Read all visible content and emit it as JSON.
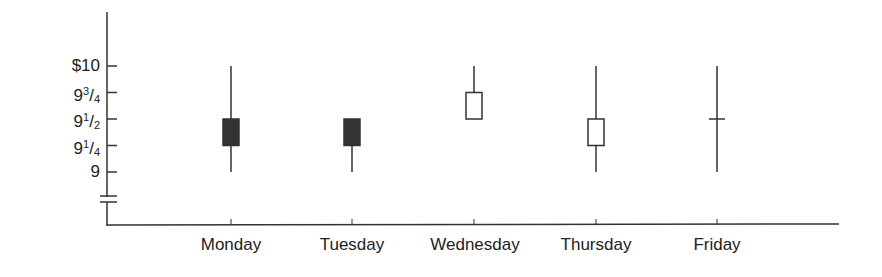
{
  "chart_data": {
    "type": "candlestick",
    "title": "",
    "xlabel": "",
    "ylabel": "",
    "categories": [
      "Monday",
      "Tuesday",
      "Wednesday",
      "Thursday",
      "Friday"
    ],
    "y_ticks": [
      {
        "value": 10,
        "label": "$10"
      },
      {
        "value": 9.75,
        "whole": "9",
        "num": "3",
        "den": "4"
      },
      {
        "value": 9.5,
        "whole": "9",
        "num": "1",
        "den": "2"
      },
      {
        "value": 9.25,
        "whole": "9",
        "num": "1",
        "den": "4"
      },
      {
        "value": 9,
        "label": "9"
      }
    ],
    "ylim": [
      9,
      10
    ],
    "axis_break": true,
    "grid": false,
    "series": [
      {
        "day": "Monday",
        "high": 10,
        "low": 9,
        "open": 9.5,
        "close": 9.25,
        "body": "filled"
      },
      {
        "day": "Tuesday",
        "high": 9.5,
        "low": 9,
        "open": 9.5,
        "close": 9.25,
        "body": "filled"
      },
      {
        "day": "Wednesday",
        "high": 10,
        "low": 9.5,
        "open": 9.5,
        "close": 9.75,
        "body": "hollow"
      },
      {
        "day": "Thursday",
        "high": 10,
        "low": 9,
        "open": 9.25,
        "close": 9.5,
        "body": "hollow"
      },
      {
        "day": "Friday",
        "high": 10,
        "low": 9,
        "open": 9.5,
        "close": 9.5,
        "body": "doji"
      }
    ],
    "colors": {
      "filled": "#333333",
      "stroke": "#333333"
    }
  }
}
